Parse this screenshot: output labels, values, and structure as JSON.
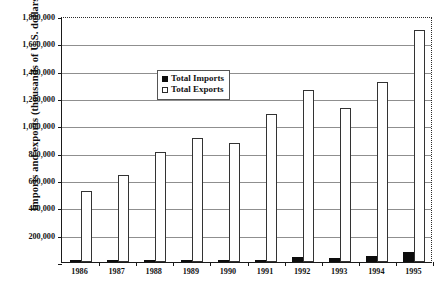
{
  "chart_data": {
    "type": "bar",
    "title": "",
    "xlabel": "",
    "ylabel": "Imports and exports (thousands of U.S. dollars)",
    "categories": [
      "1986",
      "1987",
      "1988",
      "1989",
      "1990",
      "1991",
      "1992",
      "1993",
      "1994",
      "1995"
    ],
    "series": [
      {
        "name": "Total Imports",
        "color": "#0d0d0d",
        "values": [
          3000,
          4000,
          5000,
          6000,
          14000,
          18000,
          34000,
          30000,
          45000,
          72000
        ]
      },
      {
        "name": "Total Exports",
        "color": "#ffffff",
        "values": [
          520000,
          635000,
          808000,
          905000,
          870000,
          1080000,
          1260000,
          1130000,
          1320000,
          1700000
        ]
      }
    ],
    "ylim": [
      0,
      1800000
    ],
    "y_ticks": [
      0,
      200000,
      400000,
      600000,
      800000,
      1000000,
      1200000,
      1400000,
      1600000,
      1800000
    ],
    "y_tick_labels": [
      "",
      "200,000",
      "400,000",
      "600,000",
      "800,000",
      "1,000,000",
      "1,200,000",
      "1,400,000",
      "1,600,000",
      "1,800,000"
    ],
    "grid": true,
    "legend_position": "upper-center-left",
    "legend_entries": [
      "Total Imports",
      "Total Exports"
    ]
  }
}
